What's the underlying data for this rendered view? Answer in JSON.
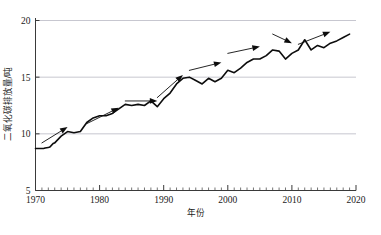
{
  "chart_data": {
    "type": "line",
    "title": "",
    "subtitle": "",
    "xlabel": "年份",
    "ylabel": "二氧化碳排放量/吨",
    "xlim": [
      1970,
      2020
    ],
    "ylim": [
      5,
      20
    ],
    "xticks": [
      1970,
      1980,
      1990,
      2000,
      2010,
      2020
    ],
    "xtick_labels": [
      "1970",
      "1980",
      "1990",
      "2000",
      "2010",
      "2020"
    ],
    "yticks": [
      5,
      10,
      15,
      20
    ],
    "ytick_labels": [
      "5",
      "10",
      "15",
      "20"
    ],
    "minor_xtick_interval": 1,
    "grid": "horizontal gridlines at 10, 15 and 20",
    "legend": "none",
    "line_color": "#000000",
    "grid_color": "#b9b9c4",
    "axis_color": "#3a3a3a",
    "x": [
      1970,
      1971,
      1972,
      1973,
      1974,
      1975,
      1976,
      1977,
      1978,
      1979,
      1980,
      1981,
      1982,
      1983,
      1984,
      1985,
      1986,
      1987,
      1988,
      1989,
      1990,
      1991,
      1992,
      1993,
      1994,
      1995,
      1996,
      1997,
      1998,
      1999,
      2000,
      2001,
      2002,
      2003,
      2004,
      2005,
      2006,
      2007,
      2008,
      2009,
      2010,
      2011,
      2012,
      2013,
      2014,
      2015,
      2016,
      2017,
      2018,
      2019
    ],
    "values": [
      8.7,
      8.7,
      8.8,
      9.2,
      9.8,
      10.2,
      10.1,
      10.2,
      11.0,
      11.4,
      11.6,
      11.6,
      11.8,
      12.2,
      12.6,
      12.5,
      12.6,
      12.5,
      12.9,
      12.4,
      13.1,
      13.6,
      14.4,
      14.9,
      15.0,
      14.7,
      14.4,
      14.9,
      14.6,
      14.9,
      15.6,
      15.4,
      15.8,
      16.3,
      16.6,
      16.6,
      16.9,
      17.4,
      17.3,
      16.6,
      17.1,
      17.4,
      18.3,
      17.4,
      17.8,
      17.6,
      18.0,
      18.2,
      18.5,
      18.8
    ],
    "annotations": [
      {
        "name": "trend-arrow-rise-1970s",
        "direction": "up-right",
        "from_year": 1971,
        "from_value": 9.2,
        "to_year": 1975,
        "to_value": 10.6
      },
      {
        "name": "trend-arrow-rise-1980s",
        "direction": "up-right",
        "from_year": 1978,
        "from_value": 10.9,
        "to_year": 1983,
        "to_value": 12.3
      },
      {
        "name": "trend-arrow-plateau-1980s",
        "direction": "right",
        "from_year": 1984,
        "from_value": 12.9,
        "to_year": 1989,
        "to_value": 12.9
      },
      {
        "name": "trend-arrow-rise-1990s",
        "direction": "up-right",
        "from_year": 1989,
        "from_value": 13.2,
        "to_year": 1993,
        "to_value": 15.2
      },
      {
        "name": "trend-arrow-rise-late1990s",
        "direction": "up-right",
        "from_year": 1994,
        "from_value": 15.6,
        "to_year": 1999,
        "to_value": 16.3
      },
      {
        "name": "trend-arrow-rise-2000s",
        "direction": "up-right",
        "from_year": 2000,
        "from_value": 17.1,
        "to_year": 2005,
        "to_value": 17.7
      },
      {
        "name": "trend-arrow-fall-2008",
        "direction": "down-right",
        "from_year": 2007,
        "from_value": 18.8,
        "to_year": 2010,
        "to_value": 18.0
      },
      {
        "name": "trend-arrow-rise-2010s",
        "direction": "up-right",
        "from_year": 2011,
        "from_value": 17.9,
        "to_year": 2016,
        "to_value": 19.0
      }
    ]
  }
}
